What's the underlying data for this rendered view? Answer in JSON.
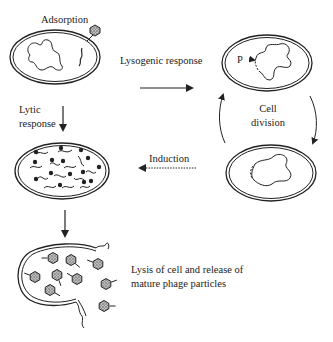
{
  "diagram": {
    "stages": {
      "adsorption": {
        "label": "Adsorption"
      },
      "lysogen": {
        "label": "P"
      },
      "dividing": {
        "label": ""
      },
      "lytic": {
        "label": ""
      },
      "lysis": {
        "label_line1": "Lysis of cell and release of",
        "label_line2": "mature phage particles"
      }
    },
    "transitions": {
      "lysogenic": {
        "label": "Lysogenic response",
        "style": "solid"
      },
      "lytic": {
        "label_line1": "Lytic",
        "label_line2": "response",
        "style": "solid"
      },
      "cell_division": {
        "label_line1": "Cell",
        "label_line2": "division",
        "style": "solid"
      },
      "induction": {
        "label": "Induction",
        "style": "dotted"
      },
      "lysis": {
        "label": "",
        "style": "solid"
      }
    },
    "colors": {
      "ink": "#222222",
      "capsid_fill": "#9a9a9a",
      "background": "#ffffff"
    }
  }
}
